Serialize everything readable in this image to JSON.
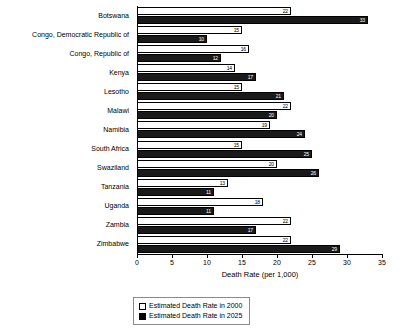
{
  "chart_data": {
    "type": "bar",
    "orientation": "horizontal",
    "title": "",
    "xlabel": "Death Rate (per 1,000)",
    "ylabel": "",
    "xlim": [
      0,
      35
    ],
    "xticks": [
      0,
      5,
      10,
      15,
      20,
      25,
      30,
      35
    ],
    "grid": false,
    "legend_position": "bottom",
    "categories": [
      "Botswana",
      "Congo, Democratic Republic of",
      "Congo, Republic of",
      "Kenya",
      "Lesotho",
      "Malawi",
      "Namibia",
      "South Africa",
      "Swaziland",
      "Tanzania",
      "Uganda",
      "Zambia",
      "Zimbabwe"
    ],
    "series": [
      {
        "name": "Estimated Death Rate in 2000",
        "color": "#ffffff",
        "values": [
          22,
          15,
          16,
          14,
          15,
          22,
          19,
          15,
          20,
          13,
          18,
          22,
          22
        ]
      },
      {
        "name": "Estimated Death Rate in 2025",
        "color": "#000000",
        "values": [
          33,
          10,
          12,
          17,
          21,
          20,
          24,
          25,
          26,
          11,
          11,
          17,
          29
        ]
      }
    ]
  },
  "legend": {
    "items": [
      {
        "label": "Estimated Death Rate in 2000",
        "swatch": "white"
      },
      {
        "label": "Estimated Death Rate in 2025",
        "swatch": "black"
      }
    ]
  }
}
